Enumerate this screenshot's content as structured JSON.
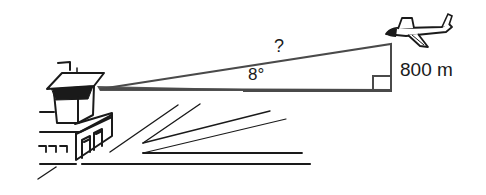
{
  "diagram": {
    "type": "trigonometry-angle-of-elevation",
    "labels": {
      "hypotenuse": "?",
      "angle": "8°",
      "opposite_side": "800 m"
    },
    "elements": {
      "observer": "control-tower",
      "target": "airplane",
      "right_angle_marker": true
    },
    "colors": {
      "ink": "#1a1a1a",
      "triangle": "#4a4a4a",
      "background": "#ffffff"
    }
  }
}
